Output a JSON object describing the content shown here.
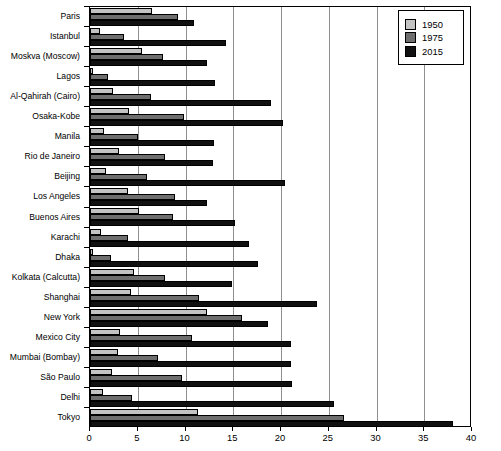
{
  "chart_data": {
    "type": "bar",
    "orientation": "horizontal",
    "title": "",
    "subtitle": "",
    "xlabel": "",
    "ylabel": "",
    "xlim": [
      0,
      40
    ],
    "xticks": [
      0,
      5,
      10,
      15,
      20,
      25,
      30,
      35,
      40
    ],
    "xtick_labels": [
      "0",
      "5",
      "10",
      "15",
      "20",
      "25",
      "30",
      "35",
      "40"
    ],
    "grid": "vertical",
    "legend_position": "top-right",
    "categories": [
      "Paris",
      "Istanbul",
      "Moskva (Moscow)",
      "Lagos",
      "Al-Qahirah (Cairo)",
      "Osaka-Kobe",
      "Manila",
      "Rio de Janeiro",
      "Beijing",
      "Los Angeles",
      "Buenos Aires",
      "Karachi",
      "Dhaka",
      "Kolkata (Calcutta)",
      "Shanghai",
      "New York",
      "Mexico City",
      "Mumbai (Bombay)",
      "São Paulo",
      "Delhi",
      "Tokyo"
    ],
    "series": [
      {
        "name": "1950",
        "color": "#c3c3c3",
        "values": [
          6.5,
          1.0,
          5.4,
          0.3,
          2.4,
          4.1,
          1.5,
          3.0,
          1.7,
          4.0,
          5.1,
          1.1,
          0.3,
          4.6,
          4.3,
          12.3,
          3.1,
          2.9,
          2.3,
          1.4,
          11.3
        ]
      },
      {
        "name": "1975",
        "color": "#6e6e6e",
        "values": [
          9.2,
          3.6,
          7.6,
          1.9,
          6.4,
          9.8,
          5.0,
          7.9,
          6.0,
          8.9,
          8.7,
          4.0,
          2.2,
          7.9,
          11.4,
          15.9,
          10.7,
          7.1,
          9.6,
          4.4,
          26.6
        ]
      },
      {
        "name": "2015",
        "color": "#111111",
        "values": [
          10.9,
          14.2,
          12.2,
          13.1,
          19.0,
          20.2,
          13.0,
          12.9,
          20.4,
          12.3,
          15.2,
          16.6,
          17.6,
          14.9,
          23.8,
          18.6,
          21.0,
          21.0,
          21.1,
          25.5,
          38.0
        ]
      }
    ]
  },
  "legend": {
    "items": [
      {
        "label": "1950",
        "color": "#c3c3c3"
      },
      {
        "label": "1975",
        "color": "#6e6e6e"
      },
      {
        "label": "2015",
        "color": "#111111"
      }
    ]
  }
}
